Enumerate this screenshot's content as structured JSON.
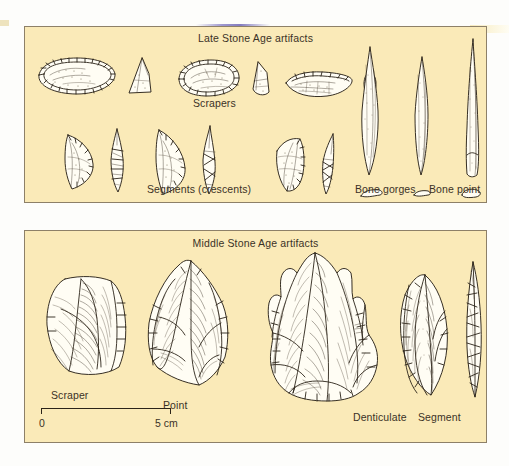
{
  "figure": {
    "background_color": "#faeab8",
    "ink_color": "#2b2419",
    "page_color": "#fdfdfb"
  },
  "panels": {
    "late_stone_age": {
      "title": "Late Stone Age artifacts",
      "labels": {
        "scrapers": "Scrapers",
        "segments": "Segments (crescents)",
        "bone_gorges": "Bone gorges",
        "bone_point": "Bone point"
      },
      "artifacts": [
        {
          "name": "scraper-1-plan",
          "type": "end scraper, plan view"
        },
        {
          "name": "scraper-1-section",
          "type": "end scraper, cross section"
        },
        {
          "name": "scraper-2-plan",
          "type": "convex scraper, plan view"
        },
        {
          "name": "scraper-2-section",
          "type": "convex scraper, cross section"
        },
        {
          "name": "scraper-3-plan",
          "type": "side scraper, plan view"
        },
        {
          "name": "scraper-3-section",
          "type": "side scraper, cross section"
        },
        {
          "name": "segment-1-plan",
          "type": "crescent, plan view"
        },
        {
          "name": "segment-1-section",
          "type": "crescent, cross section"
        },
        {
          "name": "segment-2-plan",
          "type": "crescent, plan view"
        },
        {
          "name": "segment-2-section",
          "type": "crescent, cross section"
        },
        {
          "name": "segment-3-plan",
          "type": "crescent, plan view"
        },
        {
          "name": "segment-3-section",
          "type": "crescent, cross section"
        },
        {
          "name": "bone-gorge-1",
          "type": "bipoint bone gorge"
        },
        {
          "name": "bone-gorge-1-section",
          "type": "bone gorge cross section"
        },
        {
          "name": "bone-gorge-2",
          "type": "bipoint bone gorge"
        },
        {
          "name": "bone-gorge-2-section",
          "type": "bone gorge cross section"
        },
        {
          "name": "bone-point-1",
          "type": "bone point"
        },
        {
          "name": "bone-point-1-section",
          "type": "bone point cross section"
        }
      ]
    },
    "middle_stone_age": {
      "title": "Middle Stone Age artifacts",
      "labels": {
        "scraper": "Scraper",
        "point": "Point",
        "denticulate": "Denticulate",
        "segment": "Segment"
      },
      "artifacts": [
        {
          "name": "msa-scraper",
          "type": "flake scraper, dorsal view"
        },
        {
          "name": "msa-point",
          "type": "convergent point, dorsal view"
        },
        {
          "name": "msa-denticulate",
          "type": "denticulate flake, dorsal view"
        },
        {
          "name": "msa-segment-plan",
          "type": "segment, plan view"
        },
        {
          "name": "msa-segment-section",
          "type": "segment, profile view"
        }
      ]
    }
  },
  "scale": {
    "start_label": "0",
    "end_label": "5 cm",
    "length_cm": 5
  }
}
